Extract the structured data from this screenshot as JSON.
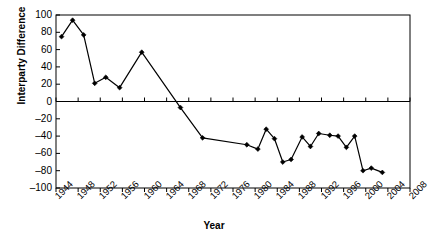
{
  "chart_data": {
    "type": "line",
    "title": "",
    "xlabel": "Year",
    "ylabel": "Interparty Difference",
    "xlim": [
      1944,
      2008
    ],
    "ylim": [
      -100,
      100
    ],
    "y_ticks": [
      100,
      80,
      60,
      40,
      20,
      0,
      -20,
      -40,
      -60,
      -80,
      -100
    ],
    "x_ticks": [
      1944,
      1948,
      1952,
      1956,
      1960,
      1964,
      1968,
      1972,
      1976,
      1980,
      1984,
      1988,
      1992,
      1996,
      2000,
      2004,
      2008
    ],
    "grid": false,
    "legend": null,
    "marker": "diamond",
    "line_color": "#000000",
    "marker_color": "#000000",
    "zero_line": true,
    "series": [
      {
        "name": "Interparty Difference",
        "x": [
          1945,
          1947,
          1949,
          1951,
          1953,
          1955,
          1957,
          1959,
          1963,
          1970,
          1974,
          1982,
          1984,
          1985,
          1987,
          1988,
          1990,
          1991,
          1993,
          1995,
          1997,
          1999,
          2000,
          2001,
          2002,
          2005
        ],
        "values": [
          75,
          94,
          77,
          21,
          28,
          16,
          27,
          57,
          57,
          -7,
          -42,
          -50,
          -55,
          -32,
          -43,
          -70,
          -67,
          -41,
          -52,
          -37,
          -39,
          -40,
          -53,
          -40,
          -80,
          -82
        ]
      }
    ],
    "points": [
      {
        "x": 1945,
        "y": 75
      },
      {
        "x": 1947,
        "y": 94
      },
      {
        "x": 1949,
        "y": 77
      },
      {
        "x": 1951,
        "y": 21
      },
      {
        "x": 1953,
        "y": 28
      },
      {
        "x": 1955.5,
        "y": 16
      },
      {
        "x": 1959.5,
        "y": 57
      },
      {
        "x": 1966.5,
        "y": -7
      },
      {
        "x": 1970.5,
        "y": -42
      },
      {
        "x": 1978.5,
        "y": -50
      },
      {
        "x": 1980.5,
        "y": -55
      },
      {
        "x": 1982,
        "y": -32
      },
      {
        "x": 1983.5,
        "y": -43
      },
      {
        "x": 1985,
        "y": -70
      },
      {
        "x": 1986.5,
        "y": -67
      },
      {
        "x": 1988.5,
        "y": -41
      },
      {
        "x": 1990,
        "y": -52
      },
      {
        "x": 1991.5,
        "y": -37
      },
      {
        "x": 1993.5,
        "y": -39
      },
      {
        "x": 1995,
        "y": -40
      },
      {
        "x": 1996.5,
        "y": -53
      },
      {
        "x": 1998,
        "y": -40
      },
      {
        "x": 1999.5,
        "y": -80
      },
      {
        "x": 2001,
        "y": -77
      },
      {
        "x": 2003,
        "y": -82
      }
    ]
  },
  "axis": {
    "y_title": "Interparty Difference",
    "x_title": "Year"
  }
}
